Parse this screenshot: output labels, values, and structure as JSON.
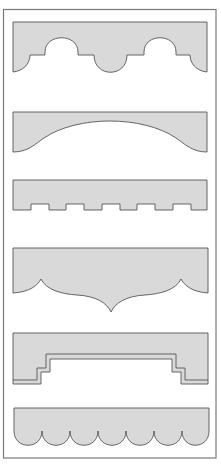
{
  "colors": {
    "background": "#ffffff",
    "frame_stroke": "#7a7a7a",
    "shape_fill": "#d9d9d9",
    "shape_stroke": "#555555"
  },
  "shapes": [
    {
      "name": "arch-and-scallop-profile",
      "label": "Arch and scallop profile"
    },
    {
      "name": "gentle-arch-profile",
      "label": "Gentle arch profile"
    },
    {
      "name": "dentil-profile",
      "label": "Dentil (notched) profile"
    },
    {
      "name": "ogee-point-profile",
      "label": "Ogee pointed profile"
    },
    {
      "name": "stepped-profile",
      "label": "Stepped profile with banding"
    },
    {
      "name": "scalloped-profile",
      "label": "Scalloped profile (7 scallops)"
    }
  ]
}
